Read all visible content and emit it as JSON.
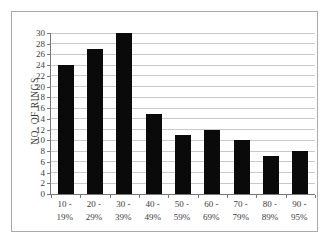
{
  "chart_data": {
    "type": "bar",
    "categories": [
      "10 - 19%",
      "20 - 29%",
      "30 - 39%",
      "40 - 49%",
      "50 - 59%",
      "60 - 69%",
      "70 - 79%",
      "80 - 89%",
      "90 - 95%"
    ],
    "values": [
      24,
      27,
      30,
      15,
      11,
      12,
      10,
      7,
      8
    ],
    "title": "",
    "xlabel": "",
    "ylabel": "NO. OF RINGS",
    "ylim": [
      0,
      30
    ],
    "ytick_step": 2,
    "yticks": [
      0,
      2,
      4,
      6,
      8,
      10,
      12,
      14,
      16,
      18,
      20,
      22,
      24,
      26,
      28,
      30
    ],
    "grid": true,
    "legend": "none",
    "colors": {
      "bar": "#0a0a0a",
      "gridline": "#c9c9c9",
      "axis": "#777777",
      "text": "#3d3d3d",
      "frame_border": "#aaaaaa",
      "background": "#ffffff"
    }
  }
}
